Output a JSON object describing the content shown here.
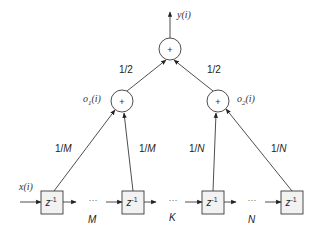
{
  "diagram": {
    "output_label": "y(i)",
    "adders": [
      {
        "id": "top",
        "symbol": "+"
      },
      {
        "id": "left",
        "symbol": "+",
        "label": "o1(i)",
        "label_base": "o",
        "label_sub": "1",
        "label_arg": "(i)"
      },
      {
        "id": "right",
        "symbol": "+",
        "label": "o2(i)",
        "label_base": "o",
        "label_sub": "2",
        "label_arg": "(i)"
      }
    ],
    "weights": {
      "top_left": "1/2",
      "top_right": "1/2",
      "left_outer": "1/M",
      "left_inner": "1/M",
      "right_inner": "1/N",
      "right_outer": "1/N"
    },
    "weight_parts": {
      "half": {
        "num": "1/",
        "den": "2"
      },
      "m": {
        "num": "1/",
        "den": "M"
      },
      "n": {
        "num": "1/",
        "den": "N"
      }
    },
    "input_label": "x(i)",
    "delay_blocks": [
      {
        "base": "z",
        "exp": "-1"
      },
      {
        "base": "z",
        "exp": "-1"
      },
      {
        "base": "z",
        "exp": "-1"
      },
      {
        "base": "z",
        "exp": "-1"
      }
    ],
    "ellipsis": "···",
    "segment_labels": [
      "M",
      "K",
      "N"
    ]
  }
}
